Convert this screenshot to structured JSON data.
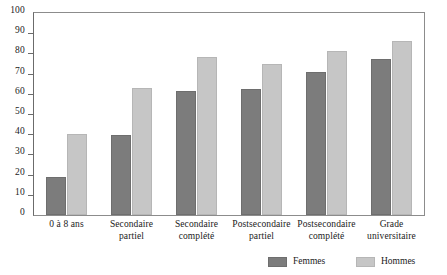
{
  "chart_data": {
    "type": "bar",
    "title": "",
    "subtitle": "",
    "xlabel": "",
    "ylabel": "",
    "ylim": [
      0,
      100
    ],
    "yticks": [
      0,
      10,
      20,
      30,
      40,
      50,
      60,
      70,
      80,
      90,
      100
    ],
    "ytick_labels": [
      "0",
      "10",
      "20",
      "30",
      "40",
      "50",
      "60",
      "70",
      "80",
      "90",
      "100"
    ],
    "grid": false,
    "legend_position": "bottom-right",
    "categories": [
      "0 à 8 ans",
      "Secondaire partiel",
      "Secondaire complété",
      "Postsecondaire partiel",
      "Postsecondaire complété",
      "Grade universitaire"
    ],
    "category_lines": [
      [
        "0 à 8 ans"
      ],
      [
        "Secondaire",
        "partiel"
      ],
      [
        "Secondaire",
        "complété"
      ],
      [
        "Postsecondaire",
        "partiel"
      ],
      [
        "Postsecondaire",
        "complété"
      ],
      [
        "Grade",
        "universitaire"
      ]
    ],
    "series": [
      {
        "name": "Femmes",
        "color": "#7c7c7c",
        "values": [
          19,
          39.5,
          61.5,
          62.5,
          71,
          77
        ]
      },
      {
        "name": "Hommes",
        "color": "#c6c6c6",
        "values": [
          40,
          63,
          78,
          75,
          81,
          86
        ]
      }
    ]
  },
  "legend": {
    "items": [
      {
        "label": "Femmes",
        "color": "#7c7c7c"
      },
      {
        "label": "Hommes",
        "color": "#c6c6c6"
      }
    ]
  },
  "colors": {
    "femmes": "#7c7c7c",
    "hommes": "#c6c6c6",
    "axis": "#6b6b6b",
    "frame": "#8c8c8c",
    "background": "#ffffff",
    "text": "#1a1a1a"
  }
}
